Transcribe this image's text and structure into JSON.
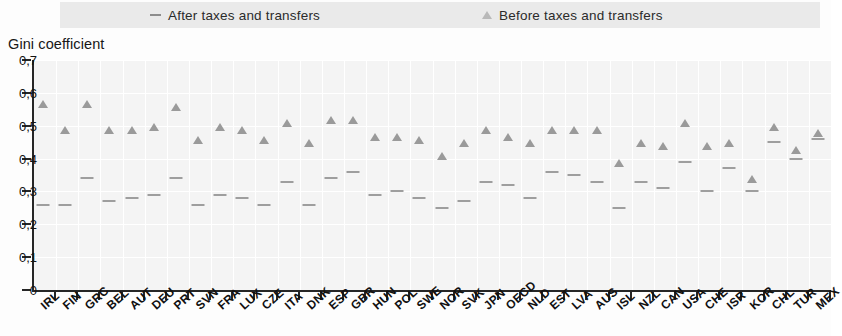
{
  "legend": {
    "after": {
      "label": "After taxes and transfers",
      "marker": "dash-marker",
      "color": "#8d8d8d"
    },
    "before": {
      "label": "Before taxes and transfers",
      "marker": "triangle-marker",
      "color": "#b9b9b9"
    }
  },
  "axis_title": "Gini coefficient",
  "y_ticks": [
    "0,7",
    "0,6",
    "0,5",
    "0,4",
    "0,3",
    "0,2",
    "0,1",
    "0"
  ],
  "chart_data": {
    "type": "scatter",
    "title": "Gini coefficient",
    "xlabel": "",
    "ylabel": "Gini coefficient",
    "ylim": [
      0,
      0.7
    ],
    "ytick_values": [
      0,
      0.1,
      0.2,
      0.3,
      0.4,
      0.5,
      0.6,
      0.7
    ],
    "ytick_labels": [
      "0",
      "0,1",
      "0,2",
      "0,3",
      "0,4",
      "0,5",
      "0,6",
      "0,7"
    ],
    "grid": true,
    "legend_position": "top",
    "categories": [
      "IRL",
      "FIN",
      "GRC",
      "BEL",
      "AUT",
      "DEU",
      "PRT",
      "SVN",
      "FRA",
      "LUX",
      "CZE",
      "ITA",
      "DNK",
      "ESP",
      "GBR",
      "HUN",
      "POL",
      "SWE",
      "NOR",
      "SVK",
      "JPN",
      "OECD",
      "NLD",
      "EST",
      "LVA",
      "AUS",
      "ISL",
      "NZL",
      "CAN",
      "USA",
      "CHE",
      "ISR",
      "KOR",
      "CHL",
      "TUR",
      "MEX"
    ],
    "series": [
      {
        "name": "Before taxes and transfers",
        "marker": "triangle",
        "color": "#9a9a9a",
        "values": [
          0.57,
          0.49,
          0.57,
          0.49,
          0.49,
          0.5,
          0.56,
          0.46,
          0.5,
          0.49,
          0.46,
          0.51,
          0.45,
          0.52,
          0.52,
          0.47,
          0.47,
          0.46,
          0.41,
          0.45,
          0.49,
          0.47,
          0.45,
          0.49,
          0.49,
          0.49,
          0.39,
          0.45,
          0.44,
          0.51,
          0.44,
          0.45,
          0.34,
          0.5,
          0.43,
          0.48
        ]
      },
      {
        "name": "After taxes and transfers",
        "marker": "dash",
        "color": "#9e9e9e",
        "values": [
          0.26,
          0.26,
          0.34,
          0.27,
          0.28,
          0.29,
          0.34,
          0.26,
          0.29,
          0.28,
          0.26,
          0.33,
          0.26,
          0.34,
          0.36,
          0.29,
          0.3,
          0.28,
          0.25,
          0.27,
          0.33,
          0.32,
          0.28,
          0.36,
          0.35,
          0.33,
          0.25,
          0.33,
          0.31,
          0.39,
          0.3,
          0.37,
          0.3,
          0.45,
          0.4,
          0.46
        ]
      }
    ]
  }
}
